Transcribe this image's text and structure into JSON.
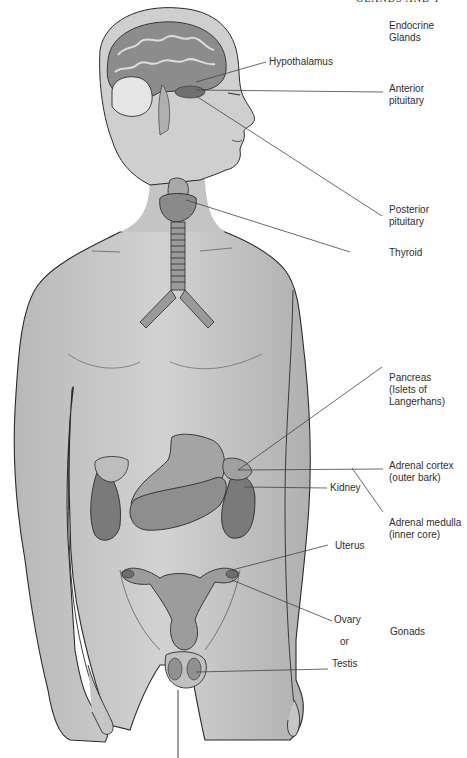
{
  "header": {
    "running_title": "GLANDS AND T"
  },
  "diagram": {
    "title": "Endocrine Glands",
    "colors": {
      "skin": "#c9c9c9",
      "skin_dark": "#a9a9a9",
      "organ": "#7e7e7e",
      "outline": "#2b2b2b",
      "leader": "#444444"
    },
    "labels": [
      {
        "id": "endocrine-glands",
        "text": "Endocrine\nGlands"
      },
      {
        "id": "hypothalamus",
        "text": "Hypothalamus"
      },
      {
        "id": "anterior-pituitary",
        "text": "Anterior\npituitary"
      },
      {
        "id": "posterior-pituitary",
        "text": "Posterior\npituitary"
      },
      {
        "id": "thyroid",
        "text": "Thyroid"
      },
      {
        "id": "pancreas",
        "text": "Pancreas\n(Islets of\nLangerhans)"
      },
      {
        "id": "adrenal-cortex",
        "text": "Adrenal cortex\n(outer bark)"
      },
      {
        "id": "kidney",
        "text": "Kidney"
      },
      {
        "id": "adrenal-medulla",
        "text": "Adrenal medulla\n(inner core)"
      },
      {
        "id": "uterus",
        "text": "Uterus"
      },
      {
        "id": "ovary",
        "text": "Ovary"
      },
      {
        "id": "or",
        "text": "or"
      },
      {
        "id": "gonads",
        "text": "Gonads"
      },
      {
        "id": "testis",
        "text": "Testis"
      }
    ]
  }
}
